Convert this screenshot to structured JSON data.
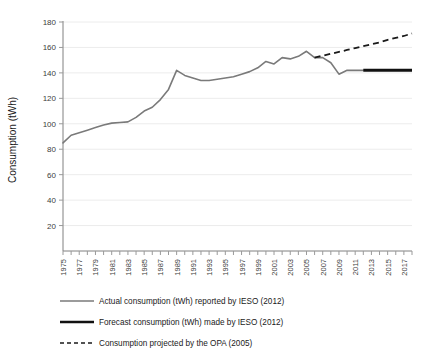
{
  "chart_data": {
    "type": "line",
    "title": "",
    "xlabel": "",
    "ylabel": "Consumption (tWh)",
    "ylim": [
      0,
      180
    ],
    "yticks": [
      20,
      40,
      60,
      80,
      100,
      120,
      140,
      160,
      180
    ],
    "xlim": [
      1975,
      2018
    ],
    "xticks": [
      1975,
      1977,
      1979,
      1981,
      1983,
      1985,
      1987,
      1989,
      1991,
      1993,
      1995,
      1997,
      1999,
      2001,
      2003,
      2005,
      2007,
      2009,
      2011,
      2013,
      2015,
      2017
    ],
    "grid": "horizontal",
    "legend_position": "bottom-left",
    "series": [
      {
        "name": "Actual consumption (tWh) reported by IESO (2012)",
        "key": "actual",
        "style": "solid-thin-gray",
        "x": [
          1975,
          1976,
          1977,
          1978,
          1979,
          1980,
          1981,
          1982,
          1983,
          1984,
          1985,
          1986,
          1987,
          1988,
          1989,
          1990,
          1991,
          1992,
          1993,
          1994,
          1995,
          1996,
          1997,
          1998,
          1999,
          2000,
          2001,
          2002,
          2003,
          2004,
          2005,
          2006,
          2007,
          2008,
          2009,
          2010,
          2011,
          2012
        ],
        "values": [
          85,
          91,
          93,
          95,
          97,
          99,
          100.5,
          101,
          101.5,
          105,
          110,
          113,
          119,
          127,
          142,
          138,
          136,
          134,
          134,
          135,
          136,
          137,
          139,
          141,
          144,
          149,
          147,
          152,
          151,
          153,
          157,
          152,
          152,
          148,
          139,
          142,
          142,
          142
        ]
      },
      {
        "name": "Forecast consumption (tWh) made by IESO (2012)",
        "key": "forecast",
        "style": "solid-thick-black",
        "x": [
          2012,
          2018
        ],
        "values": [
          142,
          142
        ]
      },
      {
        "name": "Consumption projected by the OPA (2005)",
        "key": "opa",
        "style": "dashed-black",
        "x": [
          2006,
          2007,
          2008,
          2009,
          2010,
          2011,
          2012,
          2013,
          2014,
          2015,
          2016,
          2017,
          2018
        ],
        "values": [
          152,
          153.5,
          155,
          156.5,
          158,
          159.5,
          161,
          162.5,
          164,
          166,
          167.5,
          169,
          171
        ]
      }
    ]
  },
  "legend": {
    "items": [
      {
        "label": "Actual consumption (tWh) reported by IESO (2012)",
        "key": "actual"
      },
      {
        "label": "Forecast consumption (tWh) made by IESO (2012)",
        "key": "forecast"
      },
      {
        "label": "Consumption projected by the OPA (2005)",
        "key": "opa"
      }
    ]
  }
}
